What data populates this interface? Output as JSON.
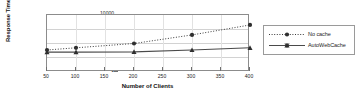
{
  "chart_data": {
    "type": "line",
    "title": "",
    "xlabel": "Number of Clients",
    "ylabel": "Response Time (ms)",
    "x": [
      50,
      100,
      200,
      300,
      400
    ],
    "xticks": [
      50,
      100,
      150,
      200,
      250,
      300,
      350,
      400
    ],
    "yticks": [
      1,
      10,
      100,
      1000,
      10000
    ],
    "yscale": "log",
    "xlim": [
      50,
      400
    ],
    "ylim": [
      1,
      10000
    ],
    "grid": true,
    "legend_position": "right-outside",
    "series": [
      {
        "name": "No cache",
        "values": [
          35,
          50,
          100,
          400,
          2000
        ],
        "line_style": "dotted",
        "marker": "circle",
        "color": "#3a3a3a"
      },
      {
        "name": "AutoWebCache",
        "values": [
          25,
          25,
          26,
          35,
          50
        ],
        "line_style": "solid",
        "marker": "triangle",
        "color": "#4a4a4a"
      }
    ]
  },
  "axes": {
    "ytick_labels": [
      "10000",
      "1000",
      "100",
      "10",
      "1"
    ],
    "xtick_labels": [
      "50",
      "100",
      "150",
      "200",
      "250",
      "300",
      "350",
      "400"
    ],
    "y_title": "Response Time (ms)",
    "x_title": "Number of Clients"
  },
  "legend": {
    "entries": [
      {
        "label": "No cache"
      },
      {
        "label": "AutoWebCache"
      }
    ]
  }
}
